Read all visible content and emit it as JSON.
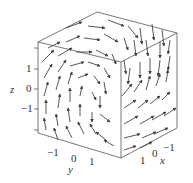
{
  "chart_data": {
    "type": "vector_field_3d",
    "title": "",
    "axes": {
      "x": {
        "label": "x",
        "ticks": [
          "-1",
          "0",
          "1"
        ],
        "range": [
          -1.5,
          1.5
        ]
      },
      "y": {
        "label": "y",
        "ticks": [
          "-1",
          "0",
          "1"
        ],
        "range": [
          -1.5,
          1.5
        ]
      },
      "z": {
        "label": "z",
        "ticks": [
          "1",
          "0",
          "-1"
        ],
        "range": [
          -1.5,
          1.5
        ]
      }
    },
    "grid": false,
    "legend": null,
    "frame_color": "#555555",
    "arrow_color": "#444444"
  },
  "labels": {
    "z_axis": "z",
    "z_ticks": [
      "1",
      "0",
      "−1"
    ],
    "y_axis": "y",
    "y_ticks": [
      "−1",
      "0",
      "1"
    ],
    "x_axis": "x",
    "x_ticks": [
      "1",
      "0",
      "−1"
    ]
  },
  "arrows": [
    [
      66,
      28,
      82,
      22
    ],
    [
      88,
      26,
      105,
      28
    ],
    [
      108,
      20,
      124,
      26
    ],
    [
      128,
      26,
      138,
      38
    ],
    [
      140,
      28,
      142,
      44
    ],
    [
      152,
      24,
      154,
      40
    ],
    [
      162,
      30,
      164,
      46
    ],
    [
      48,
      48,
      60,
      42
    ],
    [
      66,
      42,
      80,
      36
    ],
    [
      84,
      38,
      100,
      40
    ],
    [
      104,
      34,
      118,
      42
    ],
    [
      124,
      38,
      128,
      50
    ],
    [
      134,
      40,
      136,
      56
    ],
    [
      146,
      40,
      148,
      56
    ],
    [
      160,
      42,
      160,
      58
    ],
    [
      170,
      40,
      168,
      54
    ],
    [
      42,
      62,
      54,
      50
    ],
    [
      58,
      56,
      72,
      48
    ],
    [
      76,
      52,
      92,
      52
    ],
    [
      96,
      50,
      108,
      56
    ],
    [
      112,
      54,
      116,
      64
    ],
    [
      44,
      78,
      52,
      64
    ],
    [
      58,
      72,
      66,
      60
    ],
    [
      70,
      66,
      84,
      62
    ],
    [
      88,
      62,
      100,
      66
    ],
    [
      104,
      68,
      110,
      78
    ],
    [
      44,
      96,
      48,
      82
    ],
    [
      56,
      90,
      60,
      76
    ],
    [
      68,
      84,
      72,
      72
    ],
    [
      78,
      78,
      88,
      74
    ],
    [
      94,
      76,
      100,
      84
    ],
    [
      104,
      82,
      106,
      94
    ],
    [
      46,
      114,
      46,
      100
    ],
    [
      58,
      108,
      60,
      94
    ],
    [
      70,
      102,
      70,
      88
    ],
    [
      80,
      96,
      82,
      86
    ],
    [
      92,
      92,
      96,
      100
    ],
    [
      100,
      96,
      100,
      108
    ],
    [
      46,
      130,
      44,
      118
    ],
    [
      58,
      126,
      56,
      114
    ],
    [
      70,
      122,
      68,
      108
    ],
    [
      80,
      116,
      80,
      104
    ],
    [
      92,
      112,
      92,
      122
    ],
    [
      100,
      114,
      110,
      122
    ],
    [
      58,
      140,
      54,
      128
    ],
    [
      72,
      138,
      66,
      126
    ],
    [
      84,
      134,
      78,
      122
    ],
    [
      96,
      134,
      90,
      124
    ],
    [
      106,
      140,
      96,
      132
    ],
    [
      114,
      146,
      104,
      140
    ],
    [
      124,
      60,
      126,
      74
    ],
    [
      130,
      68,
      128,
      84
    ],
    [
      140,
      62,
      140,
      78
    ],
    [
      150,
      58,
      150,
      74
    ],
    [
      160,
      60,
      158,
      76
    ],
    [
      170,
      56,
      168,
      70
    ],
    [
      122,
      96,
      132,
      84
    ],
    [
      134,
      92,
      142,
      80
    ],
    [
      146,
      90,
      150,
      76
    ],
    [
      156,
      86,
      160,
      74
    ],
    [
      166,
      82,
      168,
      70
    ],
    [
      124,
      108,
      136,
      100
    ],
    [
      138,
      108,
      148,
      100
    ],
    [
      150,
      104,
      160,
      96
    ],
    [
      162,
      100,
      170,
      92
    ],
    [
      124,
      124,
      138,
      116
    ],
    [
      140,
      124,
      154,
      116
    ],
    [
      152,
      120,
      166,
      112
    ],
    [
      164,
      116,
      176,
      108
    ],
    [
      124,
      138,
      140,
      134
    ],
    [
      142,
      138,
      156,
      132
    ],
    [
      154,
      134,
      168,
      128
    ],
    [
      124,
      150,
      136,
      146
    ],
    [
      140,
      148,
      152,
      142
    ]
  ]
}
